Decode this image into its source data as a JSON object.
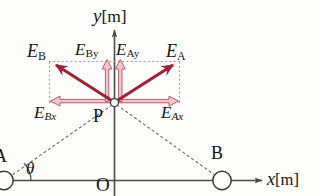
{
  "diagram": {
    "axes": {
      "y_label": "y",
      "y_unit": "[m]",
      "x_label": "x",
      "x_unit": "[m]",
      "origin_label": "O"
    },
    "points": [
      {
        "id": "P",
        "label": "P",
        "x": 114,
        "y": 103,
        "marker": "open-circle"
      },
      {
        "id": "A",
        "label": "A",
        "x": 5,
        "y": 180,
        "marker": "open-circle"
      },
      {
        "id": "B",
        "label": "B",
        "x": 222,
        "y": 180,
        "marker": "open-circle"
      }
    ],
    "angle": {
      "label": "θ",
      "at_point": "A"
    },
    "vectors": [
      {
        "name": "E_A",
        "label": "E",
        "sub": "A",
        "kind": "resultant",
        "direction": "up-right"
      },
      {
        "name": "E_B",
        "label": "E",
        "sub": "B",
        "kind": "resultant",
        "direction": "up-left"
      },
      {
        "name": "E_Ax",
        "label": "E",
        "sub": "Ax",
        "kind": "component",
        "direction": "right"
      },
      {
        "name": "E_Bx",
        "label": "E",
        "sub": "Bx",
        "kind": "component",
        "direction": "left"
      },
      {
        "name": "E_Ay",
        "label": "E",
        "sub": "Ay",
        "kind": "component",
        "direction": "up"
      },
      {
        "name": "E_By",
        "label": "E",
        "sub": "By",
        "kind": "component",
        "direction": "up"
      }
    ],
    "colors": {
      "vector_main": "#9c2436",
      "vector_component_fill": "#f0c9cf",
      "vector_component_stroke": "#b5566a",
      "guide_dotted": "#c98a95",
      "axis": "#4a4a4a",
      "dashed_ray": "#6e6e6e",
      "text": "#141414"
    }
  }
}
